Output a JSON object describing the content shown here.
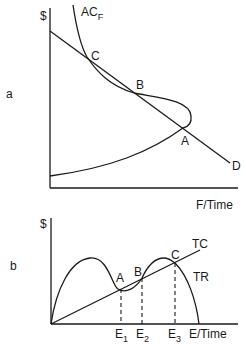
{
  "panels": [
    {
      "id": "a",
      "panel_label": "a",
      "y_axis_label": "$",
      "x_axis_label": "F/Time",
      "curves": {
        "average_cost": {
          "label": "AC",
          "subscript": "F"
        },
        "demand": {
          "label": "D"
        }
      },
      "points": {
        "A": "A",
        "B": "B",
        "C": "C"
      }
    },
    {
      "id": "b",
      "panel_label": "b",
      "y_axis_label": "$",
      "x_axis_label": "E/Time",
      "curves": {
        "total_cost": {
          "label": "TC"
        },
        "total_revenue": {
          "label": "TR"
        }
      },
      "points": {
        "A": "A",
        "B": "B",
        "C": "C"
      },
      "equilibria": [
        {
          "label": "E",
          "subscript": "1"
        },
        {
          "label": "E",
          "subscript": "2"
        },
        {
          "label": "E",
          "subscript": "3"
        }
      ]
    }
  ]
}
